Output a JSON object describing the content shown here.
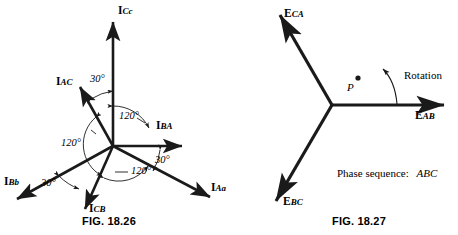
{
  "figures": [
    {
      "id": "fig-18-26",
      "caption": "FIG. 18.26",
      "vectors": [
        {
          "name": "I_Cc",
          "base": "I",
          "sub": "Cc",
          "angle_deg": 90,
          "label_x": 118,
          "label_y": 12
        },
        {
          "name": "I_BA",
          "base": "I",
          "sub": "BA",
          "angle_deg": 0,
          "label_x": 156,
          "label_y": 126
        },
        {
          "name": "I_Aa",
          "base": "I",
          "sub": "Aa",
          "angle_deg": -30,
          "label_x": 213,
          "label_y": 186
        },
        {
          "name": "I_Bb",
          "base": "I",
          "sub": "Bb",
          "angle_deg": 210,
          "label_x": 6,
          "label_y": 180
        },
        {
          "name": "I_AC",
          "base": "I",
          "sub": "AC",
          "angle_deg": 150,
          "label_x": 58,
          "label_y": 78
        },
        {
          "name": "I_CB",
          "base": "I",
          "sub": "CB",
          "angle_deg": 250,
          "label_x": 85,
          "label_y": 206
        }
      ],
      "angle_labels": [
        {
          "text": "30°",
          "x": 90,
          "y": 79
        },
        {
          "text": "120°",
          "x": 121,
          "y": 115
        },
        {
          "text": "120°",
          "x": 78,
          "y": 141
        },
        {
          "text": "120°",
          "x": 116,
          "y": 169
        },
        {
          "text": "30°",
          "x": 155,
          "y": 158
        },
        {
          "text": "30°",
          "x": 43,
          "y": 181
        }
      ]
    },
    {
      "id": "fig-18-27",
      "caption": "FIG. 18.27",
      "vectors": [
        {
          "name": "E_AB",
          "base": "E",
          "sub": "AB",
          "angle_deg": 0,
          "label_x": 415,
          "label_y": 113
        },
        {
          "name": "E_CA",
          "base": "E",
          "sub": "CA",
          "angle_deg": 120,
          "label_x": 282,
          "label_y": 10
        },
        {
          "name": "E_BC",
          "base": "E",
          "sub": "BC",
          "angle_deg": 240,
          "label_x": 278,
          "label_y": 198
        }
      ],
      "annotations": {
        "rotation_label": "Rotation",
        "point_label": "P",
        "phase_sequence_prefix": "Phase sequence:",
        "phase_sequence_value": "ABC"
      }
    }
  ],
  "colors": {
    "ink": "#1a1a1a",
    "background": "#ffffff"
  }
}
